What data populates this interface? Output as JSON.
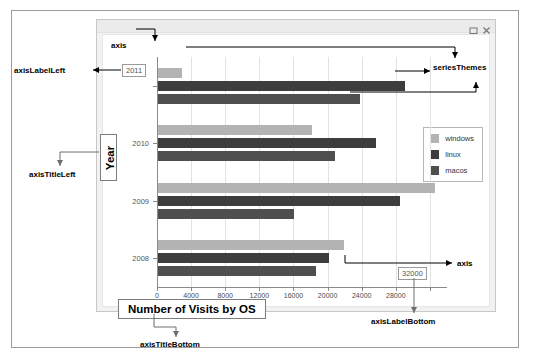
{
  "window": {
    "buttons": [
      {
        "name": "maximize-button",
        "glyph": "▭"
      },
      {
        "name": "close-button",
        "glyph": "×"
      }
    ]
  },
  "chart_data": {
    "type": "bar",
    "orientation": "horizontal",
    "title": "Number of Visits by OS",
    "xlabel": "Number of Visits by OS",
    "ylabel": "Year",
    "categories": [
      "2011",
      "2010",
      "2009",
      "2008"
    ],
    "series": [
      {
        "name": "windows",
        "color": "#b3b3b3",
        "values": [
          2800,
          18000,
          32500,
          21800
        ]
      },
      {
        "name": "linux",
        "color": "#3d3d3d",
        "values": [
          29000,
          25500,
          28400,
          20000
        ]
      },
      {
        "name": "macos",
        "color": "#4f4f4f",
        "values": [
          23700,
          20700,
          16000,
          18500
        ]
      }
    ],
    "xticks": [
      0,
      4000,
      8000,
      12000,
      16000,
      20000,
      24000,
      28000,
      32000
    ],
    "xtick_labels": [
      "0",
      "4000",
      "8000",
      "12000",
      "16000",
      "20000",
      "24000",
      "28000",
      "32000"
    ],
    "ytick_labels": [
      "2011",
      "2010",
      "2009",
      "2008"
    ],
    "xlim": [
      0,
      34000
    ],
    "grid": true,
    "legend_position": "right",
    "legend_entries": [
      "windows",
      "linux",
      "macos"
    ]
  },
  "callouts": {
    "axis_top": "axis",
    "axis_bottom": "axis",
    "axis_label_left": "axisLabelLeft",
    "axis_label_bottom": "axisLabelBottom",
    "axis_title_left": "axisTitleLeft",
    "axis_title_bottom": "axisTitleBottom",
    "series_themes": "seriesThemes"
  },
  "highlighted": {
    "axis_label_left_value": "2011",
    "axis_label_bottom_value": "32000",
    "axis_title_left_value": "Year",
    "axis_title_bottom_value": "Number of Visits by OS"
  }
}
